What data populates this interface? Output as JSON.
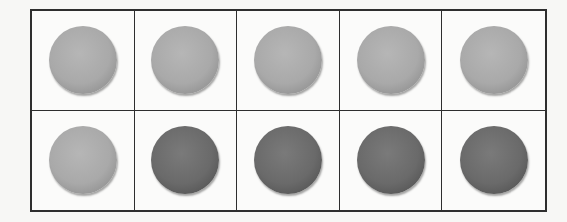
{
  "diagram": {
    "type": "ten-frame",
    "rows": 2,
    "columns": 5,
    "cells": [
      {
        "row": 1,
        "col": 1,
        "counter": "light"
      },
      {
        "row": 1,
        "col": 2,
        "counter": "light"
      },
      {
        "row": 1,
        "col": 3,
        "counter": "light"
      },
      {
        "row": 1,
        "col": 4,
        "counter": "light"
      },
      {
        "row": 1,
        "col": 5,
        "counter": "light"
      },
      {
        "row": 2,
        "col": 1,
        "counter": "light"
      },
      {
        "row": 2,
        "col": 2,
        "counter": "dark"
      },
      {
        "row": 2,
        "col": 3,
        "counter": "dark"
      },
      {
        "row": 2,
        "col": 4,
        "counter": "dark"
      },
      {
        "row": 2,
        "col": 5,
        "counter": "dark"
      }
    ],
    "counts": {
      "light": 6,
      "dark": 4,
      "total": 10
    },
    "colors": {
      "light": "#a9a9a9",
      "dark": "#6a6a6a",
      "grid": "#2e2e2e"
    }
  }
}
